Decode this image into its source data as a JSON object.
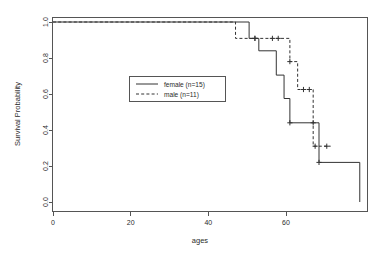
{
  "chart_data": {
    "type": "line",
    "title": "",
    "subtitle": "",
    "xlabel": "ages",
    "ylabel": "Survival Probability",
    "xlim": [
      0,
      80
    ],
    "ylim": [
      0.0,
      1.0
    ],
    "xticks": [
      0,
      20,
      40,
      60
    ],
    "xtick_labels": [
      "0",
      "20",
      "40",
      "60"
    ],
    "yticks": [
      0.0,
      0.2,
      0.4,
      0.6,
      0.8,
      1.0
    ],
    "ytick_labels": [
      "0.0",
      "0.2",
      "0.4",
      "0.6",
      "0.8",
      "1.0"
    ],
    "grid": false,
    "legend_position": "center-left",
    "plot_style": "kaplan-meier step curve",
    "series": [
      {
        "name": "female (n=15)",
        "label": "female (n=15)",
        "line_style": "solid",
        "color": "#333333",
        "n": 15,
        "steps": [
          {
            "x": 0.0,
            "y": 1.0
          },
          {
            "x": 50.5,
            "y": 1.0
          },
          {
            "x": 50.5,
            "y": 0.909
          },
          {
            "x": 53.0,
            "y": 0.909
          },
          {
            "x": 53.0,
            "y": 0.84
          },
          {
            "x": 57.5,
            "y": 0.84
          },
          {
            "x": 57.5,
            "y": 0.705
          },
          {
            "x": 59.5,
            "y": 0.705
          },
          {
            "x": 59.5,
            "y": 0.575
          },
          {
            "x": 61.0,
            "y": 0.575
          },
          {
            "x": 61.0,
            "y": 0.44
          },
          {
            "x": 68.5,
            "y": 0.44
          },
          {
            "x": 68.5,
            "y": 0.22
          },
          {
            "x": 79.0,
            "y": 0.22
          },
          {
            "x": 79.0,
            "y": 0.0
          }
        ],
        "censor_points": [
          {
            "x": 52.0,
            "y": 0.909
          },
          {
            "x": 61.0,
            "y": 0.44
          },
          {
            "x": 67.0,
            "y": 0.44
          },
          {
            "x": 68.5,
            "y": 0.22
          }
        ]
      },
      {
        "name": "male (n=11)",
        "label": "male (n=11)",
        "line_style": "dashed",
        "color": "#333333",
        "n": 11,
        "steps": [
          {
            "x": 0.0,
            "y": 1.0
          },
          {
            "x": 47.0,
            "y": 1.0
          },
          {
            "x": 47.0,
            "y": 0.909
          },
          {
            "x": 61.0,
            "y": 0.909
          },
          {
            "x": 61.0,
            "y": 0.78
          },
          {
            "x": 63.0,
            "y": 0.78
          },
          {
            "x": 63.0,
            "y": 0.625
          },
          {
            "x": 67.0,
            "y": 0.625
          },
          {
            "x": 67.0,
            "y": 0.31
          },
          {
            "x": 71.5,
            "y": 0.31
          }
        ],
        "censor_points": [
          {
            "x": 52.0,
            "y": 0.909
          },
          {
            "x": 56.5,
            "y": 0.909
          },
          {
            "x": 58.0,
            "y": 0.909
          },
          {
            "x": 61.0,
            "y": 0.78
          },
          {
            "x": 64.5,
            "y": 0.625
          },
          {
            "x": 66.0,
            "y": 0.625
          },
          {
            "x": 67.5,
            "y": 0.31
          },
          {
            "x": 70.5,
            "y": 0.31
          }
        ]
      }
    ]
  },
  "legend": {
    "entries": [
      {
        "label": "female (n=15)",
        "style": "solid"
      },
      {
        "label": "male (n=11)",
        "style": "dashed"
      }
    ]
  },
  "axes": {
    "x_title": "ages",
    "y_title": "Survival Probability"
  }
}
